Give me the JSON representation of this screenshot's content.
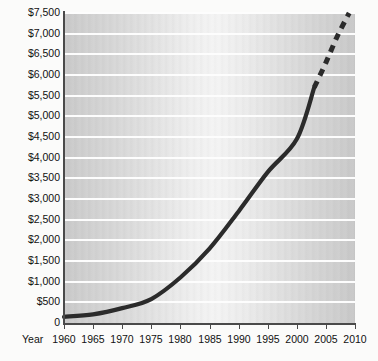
{
  "chart": {
    "title": "",
    "x_axis_title": "Year",
    "y_tick_labels": [
      "$7,500",
      "$7,000",
      "$6,500",
      "$6,000",
      "$5,500",
      "$5,000",
      "$4,500",
      "$4,000",
      "$3,500",
      "$3,000",
      "$2,500",
      "$2,000",
      "$1,500",
      "$1,000",
      "$500",
      "0"
    ],
    "x_tick_labels": [
      "1960",
      "1965",
      "1970",
      "1975",
      "1980",
      "1985",
      "1990",
      "1995",
      "2000",
      "2005",
      "2010"
    ],
    "colors": {
      "line": "#2b2b2b",
      "gridline": "#fdfdfd",
      "axis": "#4a4a4a",
      "plot_bg_edge": "#c9c9c9",
      "plot_bg_center": "#f4f4f4",
      "page_bg": "#fbfbfa",
      "text": "#111111"
    }
  },
  "chart_data": {
    "type": "line",
    "title": "",
    "xlabel": "Year",
    "ylabel": "",
    "xlim": [
      1960,
      2010
    ],
    "ylim": [
      0,
      7500
    ],
    "grid": true,
    "legend": "none",
    "x_ticks": [
      1960,
      1965,
      1970,
      1975,
      1980,
      1985,
      1990,
      1995,
      2000,
      2005,
      2010
    ],
    "y_ticks": [
      0,
      500,
      1000,
      1500,
      2000,
      2500,
      3000,
      3500,
      4000,
      4500,
      5000,
      5500,
      6000,
      6500,
      7000,
      7500
    ],
    "y_tick_labels": [
      "0",
      "$500",
      "$1,000",
      "$1,500",
      "$2,000",
      "$2,500",
      "$3,000",
      "$3,500",
      "$4,000",
      "$4,500",
      "$5,000",
      "$5,500",
      "$6,000",
      "$6,500",
      "$7,000",
      "$7,500"
    ],
    "series": [
      {
        "name": "Actual",
        "style": "solid",
        "x": [
          1960,
          1965,
          1970,
          1975,
          1980,
          1985,
          1990,
          1995,
          2000,
          2003
        ],
        "values": [
          150,
          210,
          360,
          580,
          1100,
          1800,
          2700,
          3650,
          4450,
          5700
        ]
      },
      {
        "name": "Projected",
        "style": "dashed",
        "x": [
          2003,
          2005,
          2007,
          2009
        ],
        "values": [
          5700,
          6300,
          6950,
          7500
        ]
      }
    ]
  }
}
